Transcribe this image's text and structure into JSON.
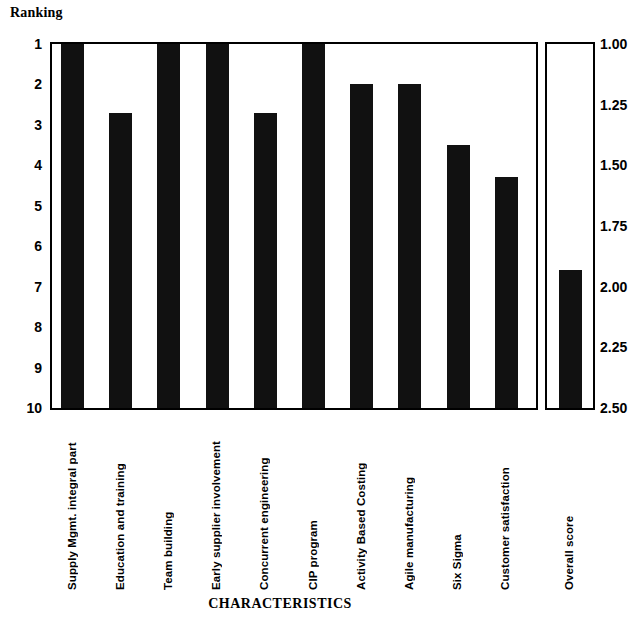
{
  "chart_data": {
    "type": "bar",
    "title": "",
    "xlabel": "CHARACTERISTICS",
    "ylabel": "Ranking",
    "grid": false,
    "legend": "none",
    "primary_axis": {
      "label": "Ranking",
      "ticks": [
        "1",
        "2",
        "3",
        "4",
        "5",
        "6",
        "7",
        "8",
        "9",
        "10"
      ],
      "ylim": [
        1,
        10
      ],
      "inverted": true,
      "position": "left"
    },
    "secondary_axis": {
      "label": "",
      "ticks": [
        "1.00",
        "1.25",
        "1.50",
        "1.75",
        "2.00",
        "2.25",
        "2.50"
      ],
      "ylim": [
        1.0,
        2.5
      ],
      "inverted": true,
      "position": "right"
    },
    "categories": [
      "Supply Mgmt. integral part",
      "Education and training",
      "Team building",
      "Early supplier involvement",
      "Concurrent engineering",
      "CIP program",
      "Activity Based Costing",
      "Agile manufacturing",
      "Six Sigma",
      "Customer satisfaction"
    ],
    "values": [
      1.0,
      2.7,
      1.0,
      1.0,
      2.7,
      1.0,
      2.0,
      2.0,
      3.5,
      4.3
    ],
    "overall": {
      "category": "Overall score",
      "value": 1.93,
      "axis": "secondary"
    }
  }
}
